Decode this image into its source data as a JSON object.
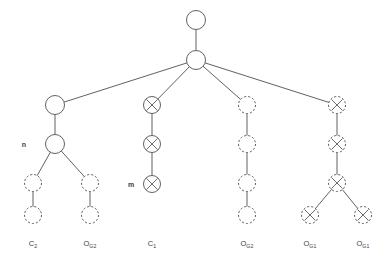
{
  "diagram": {
    "colors": {
      "stroke": "#5a5a5a",
      "edge": "#4f4f4f",
      "text": "#3d3d3d",
      "background": "#ffffff"
    },
    "legend_note": "solid circles = realized nodes; dashed circles = hypothetical nodes; X mark = crossed node",
    "node_labels": [
      {
        "id": "label-n",
        "text": "n",
        "x": 24,
        "y": 144
      },
      {
        "id": "label-m",
        "text": "m",
        "x": 131,
        "y": 184
      }
    ],
    "leaf_labels": [
      {
        "id": "leaf-c2",
        "base": "C",
        "sub": "2",
        "x": 33,
        "y": 240
      },
      {
        "id": "leaf-og2a",
        "base": "O",
        "sub": "G2",
        "x": 90,
        "y": 240
      },
      {
        "id": "leaf-c1",
        "base": "C",
        "sub": "1",
        "x": 152,
        "y": 240
      },
      {
        "id": "leaf-og2b",
        "base": "O",
        "sub": "G2",
        "x": 247,
        "y": 240
      },
      {
        "id": "leaf-og1a",
        "base": "O",
        "sub": "G1",
        "x": 310,
        "y": 240
      },
      {
        "id": "leaf-og1b",
        "base": "O",
        "sub": "G1",
        "x": 363,
        "y": 240
      }
    ],
    "nodes": [
      {
        "id": "root",
        "x": 196,
        "y": 20,
        "r": 9.5,
        "style": "solid",
        "mark": "none"
      },
      {
        "id": "root-child",
        "x": 196,
        "y": 60,
        "r": 9.5,
        "style": "solid",
        "mark": "none"
      },
      {
        "id": "b1-top",
        "x": 55,
        "y": 105,
        "r": 9.5,
        "style": "solid",
        "mark": "none"
      },
      {
        "id": "b1-n",
        "x": 55,
        "y": 144,
        "r": 9.5,
        "style": "solid",
        "mark": "none"
      },
      {
        "id": "b1-l1",
        "x": 33,
        "y": 183,
        "r": 8.5,
        "style": "dashed",
        "mark": "none"
      },
      {
        "id": "b1-l2",
        "x": 33,
        "y": 215,
        "r": 8.5,
        "style": "dashed",
        "mark": "none"
      },
      {
        "id": "b1-r1",
        "x": 90,
        "y": 183,
        "r": 8.5,
        "style": "dashed",
        "mark": "none"
      },
      {
        "id": "b1-r2",
        "x": 90,
        "y": 215,
        "r": 8.5,
        "style": "dashed",
        "mark": "none"
      },
      {
        "id": "b2-n1",
        "x": 152,
        "y": 105,
        "r": 8.5,
        "style": "solid",
        "mark": "x"
      },
      {
        "id": "b2-n2",
        "x": 152,
        "y": 144,
        "r": 8.5,
        "style": "solid",
        "mark": "x"
      },
      {
        "id": "b2-n3",
        "x": 152,
        "y": 184,
        "r": 8.5,
        "style": "solid",
        "mark": "x"
      },
      {
        "id": "b3-n1",
        "x": 247,
        "y": 105,
        "r": 8.5,
        "style": "dashed",
        "mark": "none"
      },
      {
        "id": "b3-n2",
        "x": 247,
        "y": 144,
        "r": 8.5,
        "style": "dashed",
        "mark": "none"
      },
      {
        "id": "b3-n3",
        "x": 247,
        "y": 183,
        "r": 8.5,
        "style": "dashed",
        "mark": "none"
      },
      {
        "id": "b3-n4",
        "x": 247,
        "y": 215,
        "r": 8.5,
        "style": "dashed",
        "mark": "none"
      },
      {
        "id": "b4-n1",
        "x": 337,
        "y": 105,
        "r": 8.5,
        "style": "dashed",
        "mark": "x"
      },
      {
        "id": "b4-n2",
        "x": 337,
        "y": 144,
        "r": 8.5,
        "style": "dashed",
        "mark": "x"
      },
      {
        "id": "b4-n3",
        "x": 337,
        "y": 183,
        "r": 8.5,
        "style": "dashed",
        "mark": "x"
      },
      {
        "id": "b4-l1",
        "x": 310,
        "y": 215,
        "r": 8.5,
        "style": "dashed",
        "mark": "x"
      },
      {
        "id": "b4-r1",
        "x": 363,
        "y": 215,
        "r": 8.5,
        "style": "dashed",
        "mark": "x"
      }
    ],
    "edges": [
      {
        "id": "e-root",
        "from": "root",
        "to": "root-child"
      },
      {
        "id": "e-b1",
        "from": "root-child",
        "to": "b1-top"
      },
      {
        "id": "e-b2",
        "from": "root-child",
        "to": "b2-n1"
      },
      {
        "id": "e-b3",
        "from": "root-child",
        "to": "b3-n1"
      },
      {
        "id": "e-b4",
        "from": "root-child",
        "to": "b4-n1"
      },
      {
        "id": "e-b1-a",
        "from": "b1-top",
        "to": "b1-n"
      },
      {
        "id": "e-b1-lа",
        "from": "b1-n",
        "to": "b1-l1"
      },
      {
        "id": "e-b1-lb",
        "from": "b1-l1",
        "to": "b1-l2"
      },
      {
        "id": "e-b1-ra",
        "from": "b1-n",
        "to": "b1-r1"
      },
      {
        "id": "e-b1-rb",
        "from": "b1-r1",
        "to": "b1-r2"
      },
      {
        "id": "e-b2-a",
        "from": "b2-n1",
        "to": "b2-n2"
      },
      {
        "id": "e-b2-b",
        "from": "b2-n2",
        "to": "b2-n3"
      },
      {
        "id": "e-b3-a",
        "from": "b3-n1",
        "to": "b3-n2"
      },
      {
        "id": "e-b3-b",
        "from": "b3-n2",
        "to": "b3-n3"
      },
      {
        "id": "e-b3-c",
        "from": "b3-n3",
        "to": "b3-n4"
      },
      {
        "id": "e-b4-a",
        "from": "b4-n1",
        "to": "b4-n2"
      },
      {
        "id": "e-b4-b",
        "from": "b4-n2",
        "to": "b4-n3"
      },
      {
        "id": "e-b4-l",
        "from": "b4-n3",
        "to": "b4-l1"
      },
      {
        "id": "e-b4-r",
        "from": "b4-n3",
        "to": "b4-r1"
      }
    ]
  }
}
